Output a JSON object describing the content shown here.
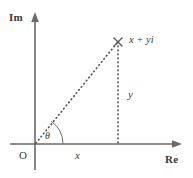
{
  "figure": {
    "type": "argand-diagram",
    "background_color": "#ffffff",
    "stroke_color": "#5a5a5a",
    "text_color": "#3a3a3a"
  },
  "axes": {
    "imaginary": {
      "label": "Im",
      "orientation": "vertical",
      "arrow": "up"
    },
    "real": {
      "label": "Re",
      "orientation": "horizontal",
      "arrow": "right"
    },
    "origin": {
      "label": "O"
    }
  },
  "annotations": {
    "angle": "θ",
    "real_component": "x",
    "imaginary_component": "y",
    "point_label": "x + yi",
    "point_marker": "cross-marker"
  },
  "geometry": {
    "origin_px": [
      35,
      144
    ],
    "point_px": [
      118,
      42
    ],
    "im_axis_top_px": [
      35,
      13
    ],
    "im_axis_bottom_px": [
      35,
      170
    ],
    "re_axis_left_px": [
      10,
      144
    ],
    "re_axis_right_px": [
      182,
      144
    ],
    "angle_arc_radius_px": 28
  }
}
